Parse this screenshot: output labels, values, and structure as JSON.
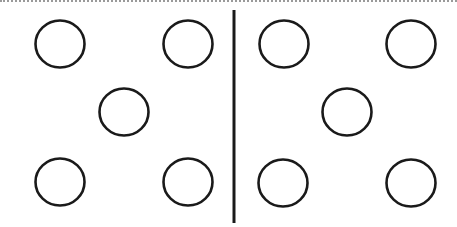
{
  "diagram": {
    "stroke_color": "#1a1a1a",
    "border_color": "#9a9a9a",
    "panels": [
      {
        "name": "left",
        "circle_count": 5,
        "arrangement": "quincunx"
      },
      {
        "name": "right",
        "circle_count": 5,
        "arrangement": "quincunx"
      }
    ]
  }
}
